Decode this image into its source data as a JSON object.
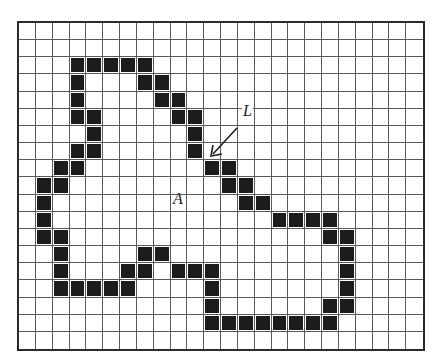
{
  "figure": {
    "grid": {
      "cols": 24,
      "rows": 19,
      "filled_color": "#1c1c1c",
      "line_color": "#5a5a5a",
      "filled_cells": [
        [
          3,
          2
        ],
        [
          4,
          2
        ],
        [
          5,
          2
        ],
        [
          6,
          2
        ],
        [
          7,
          2
        ],
        [
          3,
          3
        ],
        [
          7,
          3
        ],
        [
          8,
          3
        ],
        [
          3,
          4
        ],
        [
          8,
          4
        ],
        [
          9,
          4
        ],
        [
          3,
          5
        ],
        [
          4,
          5
        ],
        [
          9,
          5
        ],
        [
          10,
          5
        ],
        [
          4,
          6
        ],
        [
          10,
          6
        ],
        [
          3,
          7
        ],
        [
          4,
          7
        ],
        [
          10,
          7
        ],
        [
          2,
          8
        ],
        [
          3,
          8
        ],
        [
          11,
          8
        ],
        [
          12,
          8
        ],
        [
          1,
          9
        ],
        [
          2,
          9
        ],
        [
          12,
          9
        ],
        [
          13,
          9
        ],
        [
          1,
          10
        ],
        [
          13,
          10
        ],
        [
          14,
          10
        ],
        [
          1,
          11
        ],
        [
          15,
          11
        ],
        [
          16,
          11
        ],
        [
          17,
          11
        ],
        [
          18,
          11
        ],
        [
          1,
          12
        ],
        [
          2,
          12
        ],
        [
          18,
          12
        ],
        [
          19,
          12
        ],
        [
          2,
          13
        ],
        [
          7,
          13
        ],
        [
          8,
          13
        ],
        [
          19,
          13
        ],
        [
          2,
          14
        ],
        [
          6,
          14
        ],
        [
          7,
          14
        ],
        [
          9,
          14
        ],
        [
          10,
          14
        ],
        [
          11,
          14
        ],
        [
          19,
          14
        ],
        [
          2,
          15
        ],
        [
          3,
          15
        ],
        [
          4,
          15
        ],
        [
          5,
          15
        ],
        [
          6,
          15
        ],
        [
          11,
          15
        ],
        [
          19,
          15
        ],
        [
          11,
          16
        ],
        [
          18,
          16
        ],
        [
          19,
          16
        ],
        [
          11,
          17
        ],
        [
          12,
          17
        ],
        [
          13,
          17
        ],
        [
          14,
          17
        ],
        [
          15,
          17
        ],
        [
          16,
          17
        ],
        [
          17,
          17
        ],
        [
          18,
          17
        ]
      ]
    },
    "labels": {
      "region": "A",
      "boundary": "L"
    },
    "annotations": [
      {
        "label": "L",
        "description": "arrow pointing to boundary pixel"
      },
      {
        "label": "A",
        "description": "interior region"
      }
    ]
  }
}
